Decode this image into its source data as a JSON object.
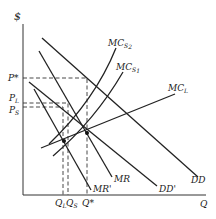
{
  "diagram": {
    "axes": {
      "y_label": "$",
      "x_label": "Q"
    },
    "price_labels": {
      "p_star": "P*",
      "p_l": "P",
      "p_l_sub": "L",
      "p_s": "P",
      "p_s_sub": "S"
    },
    "quantity_labels": {
      "q_l": "Q",
      "q_l_sub": "L",
      "q_s": "Q",
      "q_s_sub": "S",
      "q_star": "Q*"
    },
    "curves": {
      "mcs2": "MC",
      "mcs2_sub": "S",
      "mcs2_subsub": "2",
      "mcs1": "MC",
      "mcs1_sub": "S",
      "mcs1_subsub": "1",
      "mcl": "MC",
      "mcl_sub": "L",
      "dd": "DD",
      "dd_prime": "DD'",
      "mr": "MR",
      "mr_prime": "MR'"
    }
  }
}
